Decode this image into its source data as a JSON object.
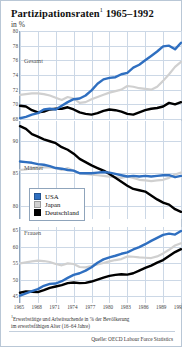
{
  "header": {
    "title": "Partizipationsraten",
    "title_footnote_marker": "1",
    "title_years": " 1965–1992",
    "subtitle": "in %"
  },
  "legend": {
    "position": "middle-left-inset",
    "items": [
      {
        "label": "USA",
        "color": "#2f6fc0"
      },
      {
        "label": "Japan",
        "color": "#d0d0d0"
      },
      {
        "label": "Deutschland",
        "color": "#000000"
      }
    ]
  },
  "footnote": {
    "marker": "1",
    "line1": "Erwerbstätige und Arbeitsuchende in % der Bevölkerung",
    "line2": "im erwerbsfähigen Alter (16–64 Jahre)"
  },
  "source": "Quelle: OECD Labour Force Statistics",
  "colors": {
    "usa": "#2f6fc0",
    "japan": "#d0d0d0",
    "deutschland": "#000000",
    "grid": "#ccd8e6",
    "axis": "#8fa4bb",
    "border": "#b9c7d6",
    "background": "#ffffff"
  },
  "chart_data": {
    "type": "line",
    "subtitle": "in %",
    "xlabel": "",
    "ylabel": "in %",
    "grid": true,
    "x": [
      1965,
      1966,
      1967,
      1968,
      1969,
      1970,
      1971,
      1972,
      1973,
      1974,
      1975,
      1976,
      1977,
      1978,
      1979,
      1980,
      1981,
      1982,
      1983,
      1984,
      1985,
      1986,
      1987,
      1988,
      1989,
      1990,
      1991,
      1992
    ],
    "xticks": [
      1965,
      1968,
      1971,
      1974,
      1977,
      1980,
      1983,
      1986,
      1989,
      1992
    ],
    "panels": [
      {
        "name": "Gesamt",
        "label": "Gesamt",
        "ylim": [
          68,
          80
        ],
        "yticks": [
          80,
          78,
          76,
          74,
          72,
          70,
          68
        ],
        "series": [
          {
            "name": "USA",
            "color": "#2f6fc0",
            "values": [
              68.1,
              68.3,
              68.6,
              68.8,
              69.3,
              69.4,
              69.3,
              69.8,
              70.3,
              70.7,
              70.8,
              71.2,
              71.9,
              72.8,
              73.4,
              73.6,
              73.7,
              74.1,
              74.3,
              75.0,
              75.4,
              76.0,
              76.6,
              77.2,
              77.9,
              78.0,
              77.5,
              78.4
            ]
          },
          {
            "name": "Japan",
            "color": "#d0d0d0",
            "values": [
              71.3,
              71.4,
              71.5,
              71.5,
              71.4,
              71.2,
              70.9,
              70.6,
              71.0,
              70.8,
              70.2,
              70.3,
              70.7,
              71.0,
              71.3,
              71.6,
              71.8,
              72.0,
              72.5,
              72.4,
              72.2,
              72.1,
              72.0,
              72.4,
              73.2,
              74.1,
              75.1,
              75.8
            ]
          },
          {
            "name": "Deutschland",
            "color": "#000000",
            "values": [
              69.8,
              69.7,
              69.2,
              68.9,
              69.0,
              69.3,
              69.4,
              69.4,
              69.6,
              69.3,
              68.9,
              68.7,
              68.6,
              68.8,
              69.1,
              69.3,
              69.2,
              69.0,
              68.7,
              68.6,
              68.9,
              69.2,
              69.4,
              69.5,
              69.7,
              70.2,
              70.0,
              70.3
            ]
          }
        ]
      },
      {
        "name": "Männer",
        "label": "Männer",
        "ylim": [
          78,
          93
        ],
        "yticks": [
          90,
          85,
          80
        ],
        "series": [
          {
            "name": "USA",
            "color": "#2f6fc0",
            "values": [
              86.8,
              86.7,
              86.6,
              86.4,
              86.3,
              86.1,
              85.8,
              85.7,
              85.5,
              85.4,
              85.0,
              85.0,
              85.0,
              85.1,
              85.2,
              85.1,
              84.9,
              84.7,
              84.5,
              84.6,
              84.5,
              84.6,
              84.5,
              84.6,
              84.7,
              84.7,
              84.4,
              84.6
            ]
          },
          {
            "name": "Japan",
            "color": "#d0d0d0",
            "values": [
              85.5,
              85.6,
              85.8,
              85.9,
              85.9,
              85.9,
              85.8,
              85.5,
              85.8,
              85.4,
              85.0,
              84.9,
              84.8,
              84.7,
              84.6,
              84.5,
              84.4,
              84.3,
              84.5,
              84.3,
              84.0,
              83.9,
              83.8,
              83.9,
              84.0,
              84.3,
              84.8,
              85.1
            ]
          },
          {
            "name": "Deutschland",
            "color": "#000000",
            "values": [
              92.2,
              91.8,
              91.0,
              90.6,
              90.2,
              89.9,
              89.6,
              89.0,
              88.6,
              88.0,
              87.2,
              86.7,
              86.2,
              85.8,
              85.4,
              84.9,
              84.3,
              83.7,
              83.1,
              82.6,
              82.4,
              82.2,
              81.6,
              81.0,
              80.5,
              80.2,
              79.5,
              79.1
            ]
          }
        ]
      },
      {
        "name": "Frauen",
        "label": "Frauen",
        "ylim": [
          43,
          66
        ],
        "yticks": [
          65,
          60,
          55,
          50,
          45
        ],
        "series": [
          {
            "name": "USA",
            "color": "#2f6fc0",
            "values": [
              45.2,
              45.9,
              46.6,
              47.2,
              48.2,
              48.8,
              48.9,
              49.6,
              50.6,
              51.5,
              52.0,
              52.8,
              53.8,
              55.2,
              56.2,
              56.8,
              57.3,
              57.9,
              58.3,
              59.2,
              59.9,
              60.8,
              61.8,
              62.7,
              63.6,
              64.0,
              63.7,
              64.8
            ]
          },
          {
            "name": "Japan",
            "color": "#d0d0d0",
            "values": [
              55.0,
              55.3,
              55.6,
              55.8,
              55.7,
              55.4,
              54.8,
              54.4,
              55.0,
              54.8,
              53.9,
              53.8,
              54.2,
              54.7,
              55.1,
              55.6,
              56.0,
              56.3,
              57.1,
              57.0,
              56.8,
              56.7,
              56.6,
              57.1,
              58.0,
              59.1,
              60.4,
              61.1
            ]
          },
          {
            "name": "Deutschland",
            "color": "#000000",
            "values": [
              46.1,
              46.5,
              46.4,
              46.3,
              46.9,
              47.6,
              48.0,
              48.4,
              49.0,
              49.2,
              49.0,
              49.1,
              49.5,
              50.1,
              50.7,
              51.2,
              51.5,
              51.7,
              51.6,
              52.0,
              52.8,
              53.6,
              54.3,
              55.2,
              56.0,
              57.2,
              58.4,
              59.3
            ]
          }
        ]
      }
    ]
  }
}
